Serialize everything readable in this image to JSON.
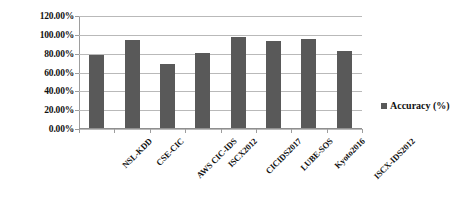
{
  "chart_data": {
    "type": "bar",
    "title": "",
    "xlabel": "",
    "ylabel": "",
    "categories": [
      "NSL-KDD",
      "CSE-CIC",
      "AWS CIC-IDS",
      "ISCX2012",
      "CICIDS2017",
      "LUBE-SOS",
      "Kyoto2016",
      "ISCX-IDS2012"
    ],
    "values": [
      78.0,
      93.0,
      68.5,
      80.0,
      96.5,
      92.0,
      95.0,
      81.5
    ],
    "series": [
      {
        "name": "Accuracy (%)",
        "values": [
          78.0,
          93.0,
          68.5,
          80.0,
          96.5,
          92.0,
          95.0,
          81.5
        ],
        "color": "#595959"
      }
    ],
    "ylim": [
      0,
      120
    ],
    "ytick_values": [
      0,
      20,
      40,
      60,
      80,
      100,
      120
    ],
    "ytick_labels": [
      "0.00%",
      "20.00%",
      "40.00%",
      "60.00%",
      "80.00%",
      "100.00%",
      "120.00%"
    ],
    "grid": true,
    "legend_position": "right",
    "legend_entries": [
      "Accuracy (%)"
    ]
  },
  "legend": {
    "label": "Accuracy (%)",
    "marker_color": "#595959",
    "marker_icon": "square-marker-icon"
  },
  "colors": {
    "bar": "#595959",
    "gridline": "#b9b9b9",
    "axis": "#9d9d9d",
    "text": "#111111",
    "background": "#ffffff"
  }
}
